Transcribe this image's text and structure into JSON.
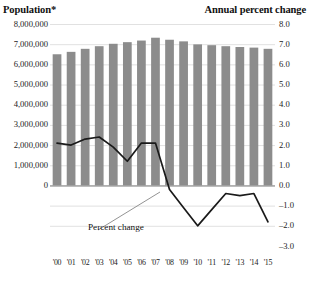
{
  "header": {
    "left_axis_title": "Population*",
    "right_axis_title": "Annual percent change"
  },
  "annotations": {
    "percent_change_label": "Percent change"
  },
  "colors": {
    "bar": "#8c8c8c",
    "line": "#1a1a1a",
    "gridline": "#d9d9d9",
    "zero_line": "#6e6e6e",
    "text": "#1a1a1a",
    "background": "#ffffff"
  },
  "chart_data": {
    "type": "bar",
    "title": "",
    "subtitle": "",
    "xlabel": "",
    "ylabel": "Population*",
    "y2label": "Annual percent change",
    "grid": true,
    "legend": "none",
    "categories": [
      "'00",
      "'01",
      "'02",
      "'03",
      "'04",
      "'05",
      "'06",
      "'07",
      "'08",
      "'09",
      "'10",
      "'11",
      "'12",
      "'13",
      "'14",
      "'15"
    ],
    "ylim": [
      0,
      8000000
    ],
    "yticks": [
      0,
      1000000,
      2000000,
      3000000,
      4000000,
      5000000,
      6000000,
      7000000,
      8000000
    ],
    "ytick_labels": [
      "0",
      "1,000,000",
      "2,000,000",
      "3,000,000",
      "4,000,000",
      "5,000,000",
      "6,000,000",
      "7,000,000",
      "8,000,000"
    ],
    "y2lim": [
      -3.0,
      8.0
    ],
    "y2ticks": [
      -3.0,
      -2.0,
      -1.0,
      0.0,
      1.0,
      2.0,
      3.0,
      4.0,
      5.0,
      6.0,
      7.0,
      8.0
    ],
    "y2tick_labels": [
      "-3.0",
      "-2.0",
      "-1.0",
      "0.0",
      "1.0",
      "2.0",
      "3.0",
      "4.0",
      "5.0",
      "6.0",
      "7.0",
      "8.0"
    ],
    "series": [
      {
        "name": "Population*",
        "type": "bar",
        "axis": "left",
        "values": [
          6500000,
          6620000,
          6770000,
          6900000,
          7020000,
          7100000,
          7180000,
          7320000,
          7220000,
          7140000,
          6990000,
          6950000,
          6900000,
          6860000,
          6830000,
          6770000
        ]
      },
      {
        "name": "Percent change",
        "type": "line",
        "axis": "right",
        "values": [
          2.1,
          2.0,
          2.3,
          2.4,
          1.9,
          1.2,
          2.1,
          2.1,
          -0.2,
          -1.1,
          -2.0,
          -1.2,
          -0.4,
          -0.5,
          -0.4,
          -1.8
        ]
      }
    ]
  }
}
